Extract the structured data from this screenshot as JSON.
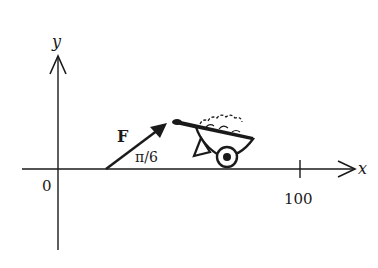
{
  "diagram": {
    "axes": {
      "x_label": "x",
      "y_label": "y",
      "origin_label": "0",
      "x_tick_label": "100"
    },
    "force": {
      "label": "F",
      "angle_label": "π/6"
    },
    "object": "wheelbarrow",
    "colors": {
      "ink": "#1a1a1a",
      "background": "#ffffff"
    }
  }
}
